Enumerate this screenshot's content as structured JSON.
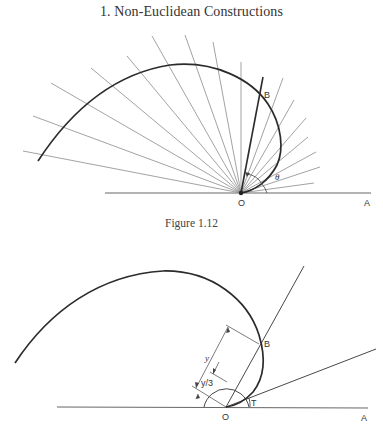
{
  "page": {
    "header": "1. Non-Euclidean Constructions"
  },
  "figure_top": {
    "caption": "Figure 1.12",
    "labels": {
      "origin": "O",
      "ray_end": "A",
      "point_b": "B",
      "angle": "θ"
    },
    "rays": [
      [
        23,
        151
      ],
      [
        33,
        116
      ],
      [
        51,
        83
      ],
      [
        91,
        68
      ],
      [
        127,
        56
      ],
      [
        152,
        36
      ],
      [
        185,
        35
      ],
      [
        213,
        42
      ],
      [
        241,
        62
      ],
      [
        283,
        78
      ],
      [
        294,
        100
      ],
      [
        306,
        118
      ],
      [
        308,
        137
      ],
      [
        316,
        152
      ],
      [
        320,
        167
      ],
      [
        314,
        183
      ]
    ],
    "bold_ray": [
      263,
      77
    ]
  },
  "figure_bottom": {
    "labels": {
      "origin": "O",
      "ray_end": "A",
      "point_b": "B",
      "point_t": "T",
      "dim_y": "y",
      "dim_y3": "y/3"
    }
  },
  "colors": {
    "curve": "#2b2b2b",
    "ray": "#7a7a7a",
    "text": "#333333"
  }
}
